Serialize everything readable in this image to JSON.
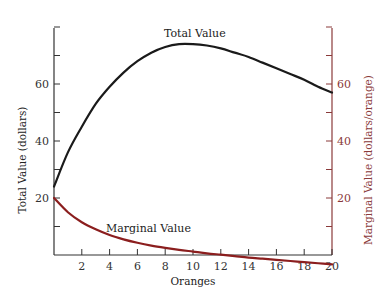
{
  "chart_data": {
    "type": "line",
    "title": "",
    "xlabel": "Oranges",
    "ylabel_left": "Total Value (dollars)",
    "ylabel_right": "Marginal Value (dollars/orange)",
    "xlim": [
      0,
      20
    ],
    "ylim_left": [
      0,
      80
    ],
    "ylim_right": [
      0,
      80
    ],
    "x_ticks": [
      2,
      4,
      6,
      8,
      10,
      12,
      14,
      16,
      18,
      20
    ],
    "y_ticks_left_labeled": [
      20,
      40,
      60
    ],
    "y_ticks_right_labeled": [
      20,
      40,
      60
    ],
    "grid": false,
    "series": [
      {
        "name": "Total Value",
        "axis": "left",
        "color": "#1a1a1a",
        "x": [
          0,
          1,
          2,
          3,
          4,
          5,
          6,
          7,
          8,
          9,
          10,
          11,
          12,
          13,
          14,
          15,
          16,
          17,
          18,
          19,
          20
        ],
        "values": [
          24,
          36,
          45,
          53,
          59,
          64,
          68,
          71,
          73,
          74,
          74,
          73.5,
          72.5,
          71,
          69.5,
          67.5,
          65.5,
          63.5,
          61.5,
          59,
          57
        ]
      },
      {
        "name": "Marginal Value",
        "axis": "right",
        "color": "#8b1e1e",
        "x": [
          0,
          1,
          2,
          3,
          4,
          5,
          6,
          7,
          8,
          9,
          10,
          11,
          12,
          13,
          14,
          15,
          16,
          17,
          18,
          19,
          20
        ],
        "values": [
          20,
          15,
          11.5,
          9,
          7,
          5.5,
          4.3,
          3.3,
          2.5,
          1.8,
          1.2,
          0.6,
          0.1,
          -0.4,
          -0.9,
          -1.3,
          -1.7,
          -2.1,
          -2.5,
          -2.9,
          -3.3
        ]
      }
    ],
    "annotations": [
      "Total Value",
      "Marginal Value"
    ]
  },
  "labels": {
    "total_value": "Total Value",
    "marginal_value": "Marginal Value",
    "xlabel": "Oranges",
    "ylabel_left": "Total Value (dollars)",
    "ylabel_right": "Marginal Value (dollars/orange)"
  }
}
